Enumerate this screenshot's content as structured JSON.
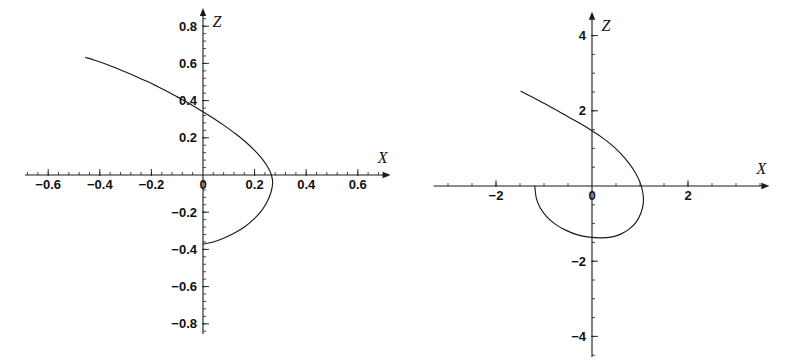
{
  "figure": {
    "background": "#ffffff",
    "ink_color": "#1a1a1a",
    "panel_count": 2
  },
  "chart_data": [
    {
      "type": "line",
      "id": "left-panel",
      "title": "",
      "subtitle": "",
      "xlabel": "X",
      "ylabel": "Z",
      "xlim": [
        -0.72,
        0.72
      ],
      "ylim": [
        -0.86,
        0.86
      ],
      "grid": false,
      "legend": null,
      "axes_style": "centered-cross-arrows",
      "xticks": [
        -0.6,
        -0.4,
        -0.2,
        0,
        0.2,
        0.4,
        0.6
      ],
      "xticklabels": [
        "−0.6",
        "−0.4",
        "−0.2",
        "0",
        "0.2",
        "0.4",
        "0.6"
      ],
      "yticks": [
        -0.8,
        -0.6,
        -0.4,
        -0.2,
        0.2,
        0.4,
        0.6,
        0.8
      ],
      "yticklabels": [
        "−0.8",
        "−0.6",
        "−0.4",
        "−0.2",
        "0.2",
        "0.4",
        "0.6",
        "0.8"
      ],
      "minor_ticks_per_interval": 5,
      "x_axis_name": "X",
      "y_axis_name": "Z",
      "annotations": [],
      "series": [
        {
          "name": "trajectory-left",
          "description": "Descending branch from upper-left that wraps into a closed teardrop loop crossing the Z axis",
          "points": [
            [
              -0.455,
              0.632
            ],
            [
              -0.42,
              0.617
            ],
            [
              -0.38,
              0.598
            ],
            [
              -0.34,
              0.577
            ],
            [
              -0.3,
              0.554
            ],
            [
              -0.26,
              0.53
            ],
            [
              -0.22,
              0.505
            ],
            [
              -0.18,
              0.478
            ],
            [
              -0.14,
              0.45
            ],
            [
              -0.1,
              0.42
            ],
            [
              -0.06,
              0.39
            ],
            [
              -0.02,
              0.356
            ],
            [
              0.0,
              0.34
            ],
            [
              0.04,
              0.305
            ],
            [
              0.08,
              0.268
            ],
            [
              0.12,
              0.228
            ],
            [
              0.16,
              0.184
            ],
            [
              0.2,
              0.132
            ],
            [
              0.23,
              0.085
            ],
            [
              0.252,
              0.04
            ],
            [
              0.265,
              0.0
            ],
            [
              0.27,
              -0.04
            ],
            [
              0.264,
              -0.09
            ],
            [
              0.25,
              -0.14
            ],
            [
              0.228,
              -0.19
            ],
            [
              0.198,
              -0.236
            ],
            [
              0.162,
              -0.278
            ],
            [
              0.122,
              -0.312
            ],
            [
              0.08,
              -0.34
            ],
            [
              0.04,
              -0.36
            ],
            [
              0.0,
              -0.372
            ]
          ]
        }
      ]
    },
    {
      "type": "line",
      "id": "right-panel",
      "title": "",
      "subtitle": "",
      "xlabel": "X",
      "ylabel": "Z",
      "xlim": [
        -3.4,
        3.6
      ],
      "ylim": [
        -4.6,
        4.6
      ],
      "grid": false,
      "legend": null,
      "axes_style": "centered-cross-arrows",
      "xticks": [
        -2,
        0,
        2
      ],
      "xticklabels": [
        "−2",
        "0",
        "2"
      ],
      "yticks": [
        -4,
        -2,
        2,
        4
      ],
      "yticklabels": [
        "−4",
        "−2",
        "2",
        "4"
      ],
      "minor_ticks_per_interval": 4,
      "x_axis_name": "X",
      "y_axis_name": "Z",
      "annotations": [],
      "series": [
        {
          "name": "trajectory-right",
          "description": "Straight descending branch from upper-left joining a large closed loop that encircles the origin region",
          "points": [
            [
              -1.48,
              2.52
            ],
            [
              -1.3,
              2.4
            ],
            [
              -1.1,
              2.27
            ],
            [
              -0.9,
              2.13
            ],
            [
              -0.7,
              1.99
            ],
            [
              -0.5,
              1.84
            ],
            [
              -0.3,
              1.7
            ],
            [
              -0.14,
              1.58
            ],
            [
              0.02,
              1.45
            ],
            [
              0.22,
              1.28
            ],
            [
              0.42,
              1.08
            ],
            [
              0.6,
              0.86
            ],
            [
              0.76,
              0.62
            ],
            [
              0.9,
              0.36
            ],
            [
              1.0,
              0.1
            ],
            [
              1.06,
              -0.18
            ],
            [
              1.07,
              -0.45
            ],
            [
              1.02,
              -0.72
            ],
            [
              0.92,
              -0.96
            ],
            [
              0.78,
              -1.14
            ],
            [
              0.6,
              -1.28
            ],
            [
              0.4,
              -1.36
            ],
            [
              0.18,
              -1.38
            ],
            [
              -0.06,
              -1.36
            ],
            [
              -0.3,
              -1.3
            ],
            [
              -0.54,
              -1.18
            ],
            [
              -0.76,
              -1.02
            ],
            [
              -0.94,
              -0.82
            ],
            [
              -1.08,
              -0.58
            ],
            [
              -1.16,
              -0.32
            ],
            [
              -1.19,
              -0.04
            ],
            [
              -1.2,
              0.0
            ]
          ]
        }
      ]
    }
  ]
}
